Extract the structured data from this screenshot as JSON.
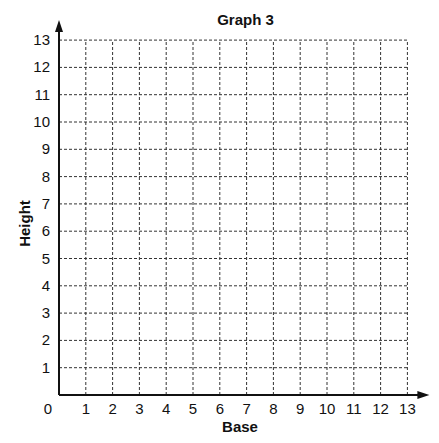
{
  "chart_data": {
    "type": "scatter",
    "title": "Graph 3",
    "xlabel": "Base",
    "ylabel": "Height",
    "xlim": [
      0,
      13
    ],
    "ylim": [
      0,
      13
    ],
    "x_ticks": [
      "1",
      "2",
      "3",
      "4",
      "5",
      "6",
      "7",
      "8",
      "9",
      "10",
      "11",
      "12",
      "13"
    ],
    "y_ticks": [
      "1",
      "2",
      "3",
      "4",
      "5",
      "6",
      "7",
      "8",
      "9",
      "10",
      "11",
      "12",
      "13"
    ],
    "origin_label": "0",
    "grid": "dashed",
    "series": []
  }
}
